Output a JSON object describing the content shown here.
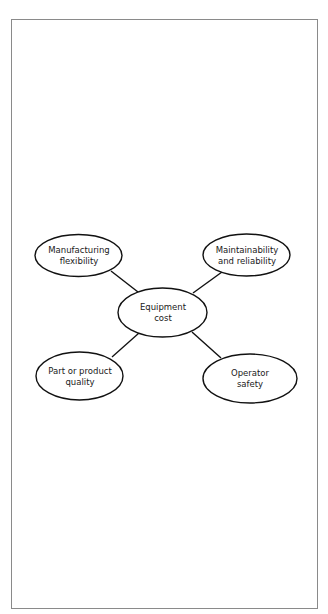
{
  "diagram": {
    "title": "",
    "colors": {
      "stroke": "#111111",
      "frame": "#8a8a8a",
      "background": "#ffffff"
    },
    "center": {
      "id": "equipment-cost",
      "line1": "Equipment",
      "line2": "cost"
    },
    "nodes": [
      {
        "id": "manufacturing-flexibility",
        "line1": "Manufacturing",
        "line2": "flexibility"
      },
      {
        "id": "maintainability-reliability",
        "line1": "Maintainability",
        "line2": "and reliability"
      },
      {
        "id": "part-product-quality",
        "line1": "Part or product",
        "line2": "quality"
      },
      {
        "id": "operator-safety",
        "line1": "Operator",
        "line2": "safety"
      }
    ],
    "edges": [
      {
        "from": "manufacturing-flexibility",
        "to": "equipment-cost"
      },
      {
        "from": "maintainability-reliability",
        "to": "equipment-cost"
      },
      {
        "from": "part-product-quality",
        "to": "equipment-cost"
      },
      {
        "from": "operator-safety",
        "to": "equipment-cost"
      }
    ]
  }
}
